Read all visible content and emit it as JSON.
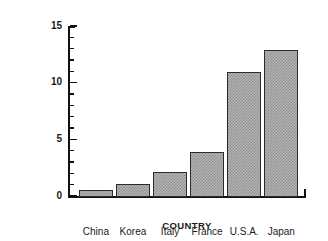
{
  "chart_data": {
    "type": "bar",
    "title": "",
    "xlabel": "COUNTRY",
    "ylabel": "MILLIONS OF UNITS",
    "categories": [
      "China",
      "Korea",
      "Italy",
      "France",
      "U.S.A.",
      "Japan"
    ],
    "values": [
      0.5,
      1.1,
      2.1,
      3.9,
      10.9,
      12.9
    ],
    "ylim": [
      0,
      15
    ],
    "ytick_labels": [
      "0",
      "5",
      "10",
      "15"
    ],
    "ytick_values": [
      0,
      5,
      10,
      15
    ],
    "yminor_step": 1,
    "grid": false,
    "legend": false,
    "legend_position": "none",
    "bar_fill_color": "#b3b3b3",
    "bar_edge_color": "#2b2b2b",
    "axis_color": "#111111",
    "background_color": "#ffffff"
  }
}
